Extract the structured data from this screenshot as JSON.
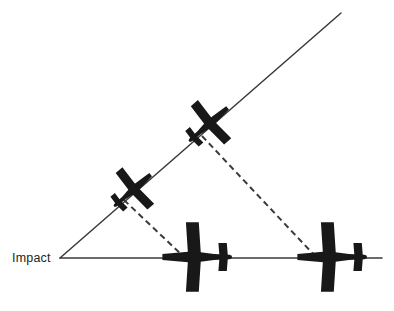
{
  "figure": {
    "background_color": "#ffffff",
    "width": 394,
    "height": 311
  },
  "labels": {
    "impact": "Impact"
  },
  "colors": {
    "line": "#3a3a3c",
    "dashed_line": "#3a3a3c",
    "aircraft_fill": "#181818",
    "text": "#231f20",
    "background": "#ffffff"
  },
  "geometry": {
    "impact_point": {
      "x": 60,
      "y": 258
    },
    "climb_line": {
      "x1": 60,
      "y1": 258,
      "x2": 341,
      "y2": 13,
      "label": "flight-path-climb-line"
    },
    "ground_line": {
      "x1": 60,
      "y1": 258,
      "x2": 384,
      "y2": 258,
      "label": "ground-track-line"
    },
    "ground_line_tail_dash": {
      "x1": 360,
      "y1": 258,
      "x2": 384,
      "y2": 258
    },
    "projection_lines": [
      {
        "name": "projection-line-lower",
        "x1": 124,
        "y1": 200,
        "x2": 184,
        "y2": 257
      },
      {
        "name": "projection-line-upper",
        "x1": 202,
        "y1": 136,
        "x2": 316,
        "y2": 257
      }
    ]
  },
  "aircraft": [
    {
      "name": "aircraft-climbing-lower",
      "orientation": "diagonal",
      "cx": 133,
      "cy": 190,
      "angle_deg": -41,
      "scale": 1.0
    },
    {
      "name": "aircraft-climbing-upper",
      "orientation": "diagonal",
      "cx": 209,
      "cy": 124,
      "angle_deg": -41,
      "scale": 1.0
    },
    {
      "name": "aircraft-plan-center",
      "orientation": "horizontal",
      "cx": 196,
      "cy": 257,
      "angle_deg": 0,
      "scale": 1.0
    },
    {
      "name": "aircraft-plan-right",
      "orientation": "horizontal",
      "cx": 331,
      "cy": 257,
      "angle_deg": 0,
      "scale": 1.0
    }
  ]
}
